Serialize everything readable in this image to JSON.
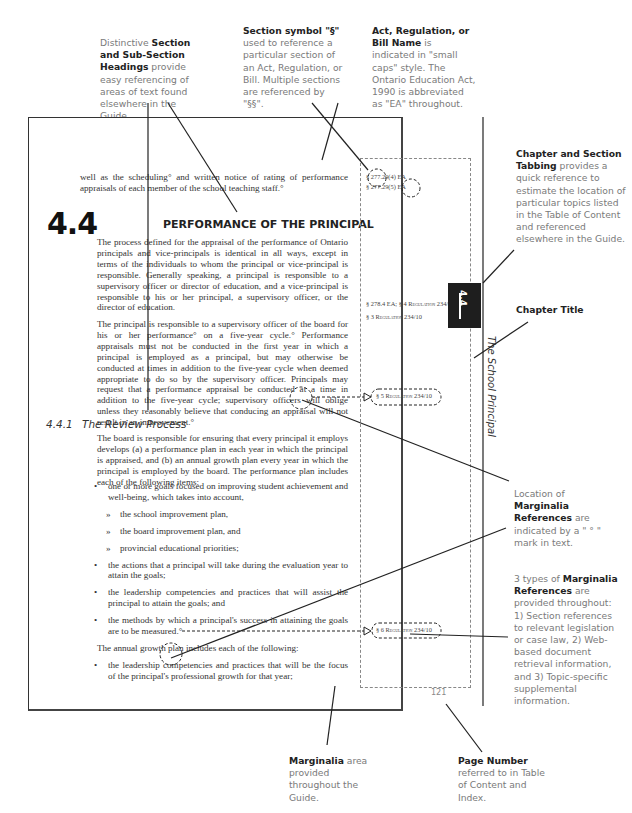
{
  "callouts": {
    "headings": {
      "bold": "Section and Sub-Section Headings",
      "pre": "Distinctive ",
      "post": " provide easy referencing of areas of text found elsewhere in the Guide."
    },
    "section_symbol": {
      "bold": "Section symbol \"§\"",
      "post": " used to reference a particular section of an Act, Regulation, or Bill. Multiple sections are referenced by \"§§\"."
    },
    "act_name": {
      "bold": "Act, Regulation, or Bill Name",
      "post": " is indicated in \"small caps\" style.  The Ontario Education Act, 1990 is abbreviated as \"EA\" throughout."
    },
    "tabbing": {
      "bold": "Chapter and Section Tabbing",
      "post": " provides a quick reference to estimate the location of particular topics listed in the Table of Content and referenced elsewhere in the Guide."
    },
    "chapter_title": {
      "bold": "Chapter Title"
    },
    "location": {
      "pre": "Location of ",
      "bold": "Marginalia References",
      "post": " are indicated by a \" ° \" mark in text."
    },
    "types": {
      "pre": "3 types of ",
      "bold": "Marginalia References",
      "post": " are provided throughout: 1) Section references to relevant legislation or case law, 2) Web-based document retrieval information, and 3) Topic-specific supplemental information."
    },
    "marginalia_area": {
      "bold": "Marginalia",
      "post": " area provided throughout the Guide."
    },
    "page_number": {
      "bold": "Page Number",
      "post": " referred to in Table of Content and Index."
    }
  },
  "page": {
    "intro_text": "well as the scheduling° and written notice of rating of performance appraisals of each member of the school teaching staff.°",
    "section_number": "4.4",
    "section_title": "PERFORMANCE OF THE PRINCIPAL",
    "paragraph_1": "The process defined for the appraisal of the performance of Ontario principals and vice-principals is identical in all ways, except in terms of the individuals to whom the principal or vice-principal is responsible.  Generally speaking, a principal is responsible to a supervisory officer or director of education, and a vice-principal is responsible to his or her principal, a supervisory officer, or the director of education.",
    "paragraph_2": "The principal is responsible to a supervisory officer of the board for his or her performance° on a five-year cycle.°  Performance appraisals must not be conducted in the first year in which a principal is employed as a principal, but may otherwise be conducted at times in addition to the five-year cycle when deemed appropriate to do so by the supervisory officer. Principals may request that a performance appraisal be conducted at a time in addition to the five-year cycle; supervisory officers will oblige unless they reasonably believe that conducing an appraisal will not result in an improvement.°",
    "subsection_number": "4.4.1",
    "subsection_title": "The Review Process",
    "paragraph_3": "The board is responsible for ensuring that every principal it employs develops (a) a performance plan in each year in which the principal is appraised, and (b) an annual growth plan every year in which the principal is employed by the board.  The performance plan includes each of the following items:",
    "bullets_1": [
      {
        "text": "one or more goals focused on improving student achievement and well-being, which takes into account,",
        "sub": false
      },
      {
        "text": "the school improvement plan,",
        "sub": true
      },
      {
        "text": "the board improvement plan, and",
        "sub": true
      },
      {
        "text": "provincial educational priorities;",
        "sub": true
      },
      {
        "text": "the actions that a principal will take during the evaluation year to attain the goals;",
        "sub": false
      },
      {
        "text": "the leadership competencies and practices that will assist the principal to attain the goals; and",
        "sub": false
      },
      {
        "text": "the methods by which a principal's success in attaining the goals are to be measured.°",
        "sub": false
      }
    ],
    "paragraph_4": "The annual growth plan includes each of the following:",
    "bullets_2": [
      {
        "text": "the leadership competencies and practices that will be the focus of the principal's professional growth for that year;",
        "sub": false
      }
    ],
    "marginalia": {
      "ref_1": "§ 277.29(4) EA",
      "ref_2": "§ 277.29(5) EA",
      "ref_3": "§ 278.4 EA; § 4 Regulation 234/10",
      "ref_4": "§ 3 Regulation 234/10",
      "ref_5": "§ 5 Regulation 234/10",
      "ref_6": "§ 6 Regulation 234/10"
    },
    "tab_label": "4.4",
    "chapter_title": "The School Principal",
    "page_number": "121"
  }
}
